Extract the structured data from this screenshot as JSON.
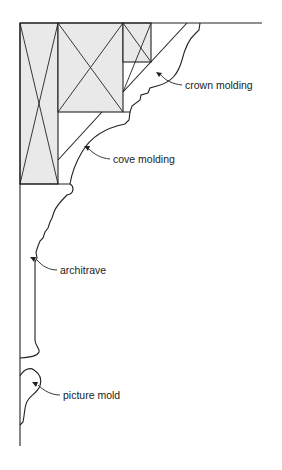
{
  "diagram": {
    "type": "cross-section of interior wall-ceiling moldings",
    "colors": {
      "line": "#222222",
      "framing_fill": "#e9e9e9",
      "background": "#ffffff"
    },
    "labels": [
      {
        "id": "crown",
        "text": "crown molding"
      },
      {
        "id": "cove",
        "text": "cove molding"
      },
      {
        "id": "architrave",
        "text": "architrave"
      },
      {
        "id": "picture",
        "text": "picture mold"
      }
    ]
  }
}
